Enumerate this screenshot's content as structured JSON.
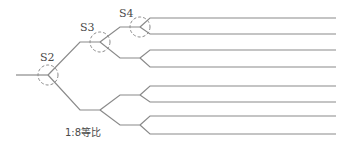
{
  "diagram": {
    "caption": "1:8等比",
    "stages": [
      {
        "id": "S2",
        "label": "S2",
        "cx": 48,
        "cy": 75,
        "r": 10,
        "lx": 40,
        "ly": 61
      },
      {
        "id": "S3",
        "label": "S3",
        "cx": 100,
        "cy": 42,
        "r": 10,
        "lx": 80,
        "ly": 31
      },
      {
        "id": "S4",
        "label": "S4",
        "cx": 140,
        "cy": 27,
        "r": 10,
        "lx": 119,
        "ly": 17
      }
    ],
    "ratio": "1:8",
    "output_count": 8,
    "colors": {
      "line": "#8a8a8a",
      "text": "#4a4a4a",
      "background": "#ffffff"
    }
  }
}
